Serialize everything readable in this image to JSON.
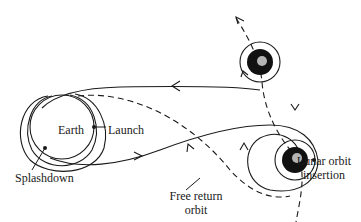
{
  "diagram": {
    "type": "orbital trajectory diagram",
    "labels": {
      "earth": "Earth",
      "launch": "Launch",
      "splashdown": "Splashdown",
      "free_return_line1": "Free return",
      "free_return_line2": "orbit",
      "lunar_insertion_line1": "Lunar orbit",
      "lunar_insertion_line2": "insertion"
    },
    "bodies": [
      {
        "name": "Earth",
        "role": "origin"
      },
      {
        "name": "Moon (later position)",
        "role": "departure"
      },
      {
        "name": "Moon (arrival position)",
        "role": "lunar orbit insertion"
      }
    ],
    "paths": [
      {
        "name": "outbound trajectory",
        "style": "solid"
      },
      {
        "name": "return trajectory",
        "style": "solid"
      },
      {
        "name": "free return orbit",
        "style": "dashed"
      },
      {
        "name": "moon path",
        "style": "dashed"
      }
    ],
    "colors": {
      "ink": "#1a1a1a",
      "background": "#ffffff"
    }
  }
}
